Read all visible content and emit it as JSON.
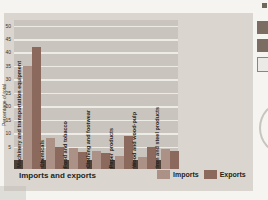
{
  "figure": {
    "title": "Imports and exports",
    "y_axis_title": "Percentage of total"
  },
  "chart_data": {
    "type": "bar",
    "title": "Imports and exports",
    "xlabel": "",
    "ylabel": "Percentage of total",
    "ylim": [
      0,
      50
    ],
    "yticks": [
      5,
      10,
      15,
      20,
      25,
      30,
      35,
      40,
      45,
      50
    ],
    "grid": true,
    "legend_position": "bottom-right",
    "categories": [
      "Machinery and transportation equipment",
      "Chemicals",
      "Food and tobacco",
      "Clothing and footwear",
      "Paper products",
      "Wood and wood-pulp",
      "Iron and steel products"
    ],
    "series": [
      {
        "name": "Imports",
        "color": "#ac9186",
        "values": [
          35,
          8,
          4.5,
          3.5,
          1.5,
          1,
          4
        ]
      },
      {
        "name": "Exports",
        "color": "#8b6a5d",
        "values": [
          42,
          5,
          3,
          2.5,
          9,
          5,
          3.5
        ]
      }
    ]
  },
  "colors": {
    "plot_background": "#c9c5be",
    "figure_background": "#dad6cf",
    "baseline_band": "#4e413a",
    "gridline": "#edebe6",
    "text": "#241f1a"
  }
}
